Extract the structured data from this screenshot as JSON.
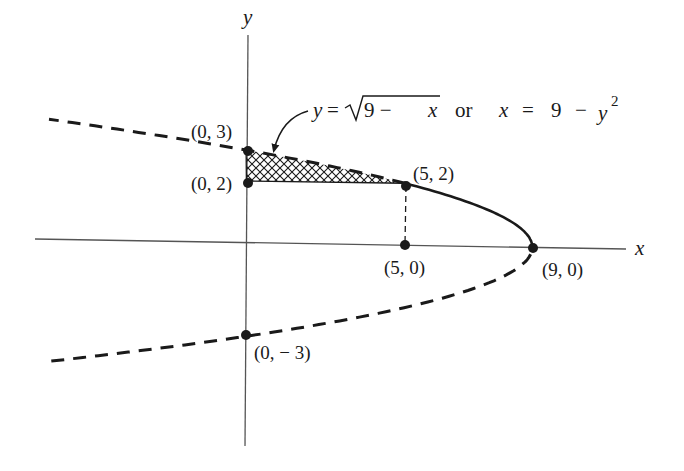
{
  "chart_data": {
    "type": "line",
    "title": "",
    "xlabel": "x",
    "ylabel": "y",
    "grid": false,
    "curve": {
      "equation_upper": "y = √(9 − x)",
      "equation_full": "x = 9 − y²",
      "solid_segment": {
        "y_from": 0,
        "y_to": 2
      },
      "dashed_segments": [
        {
          "y_from": 2,
          "y_to": 3.9
        },
        {
          "y_from": -3.9,
          "y_to": 0
        }
      ]
    },
    "shaded_region": {
      "pattern": "crosshatch",
      "vertices_description": "bounded by x=0, y=2, and y=√(9−x) from x=0 to x=5",
      "x_range": [
        0,
        5
      ],
      "y_range": [
        2,
        3
      ]
    },
    "dashed_vertical_segment": {
      "x": 5,
      "y_from": 0,
      "y_to": 2
    },
    "points": [
      {
        "x": 0,
        "y": 3,
        "label": "(0, 3)"
      },
      {
        "x": 0,
        "y": 2,
        "label": "(0, 2)"
      },
      {
        "x": 5,
        "y": 2,
        "label": "(5, 2)"
      },
      {
        "x": 5,
        "y": 0,
        "label": "(5, 0)"
      },
      {
        "x": 9,
        "y": 0,
        "label": "(9, 0)"
      },
      {
        "x": 0,
        "y": -3,
        "label": "(0, − 3)"
      }
    ]
  },
  "labels": {
    "x_axis": "x",
    "y_axis": "y",
    "p03": "(0, 3)",
    "p02": "(0, 2)",
    "p52": "(5, 2)",
    "p50": "(5, 0)",
    "p90": "(9, 0)",
    "p0m3": "(0, − 3)",
    "eq_y": "y",
    "eq_eq1": "=",
    "eq_sqrt_body": "9 − ",
    "eq_sqrt_x": "x",
    "eq_or": "or",
    "eq_x": "x",
    "eq_eq2": "=",
    "eq_nine": "9",
    "eq_minus": "−",
    "eq_y2": "y",
    "eq_sup": "2"
  },
  "colors": {
    "ink": "#1a1a1a",
    "axis": "#555555",
    "background": "#ffffff"
  }
}
